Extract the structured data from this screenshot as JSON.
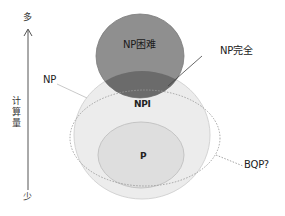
{
  "axis": {
    "top_label": "多",
    "bottom_label": "少",
    "title_chars": [
      "计",
      "算",
      "量"
    ],
    "title": "计算量"
  },
  "sets": {
    "np_hard": {
      "label": "NP困难",
      "fill": "#8f8f8f",
      "stroke": "#777777"
    },
    "np_complete": {
      "label": "NP完全",
      "fill": "#6b6b6b"
    },
    "np": {
      "label": "NP",
      "fill": "#ececec",
      "stroke": "#d4d4d4"
    },
    "npi": {
      "label": "NPI"
    },
    "p": {
      "label": "P",
      "fill": "#dedede",
      "stroke": "#c4c4c4"
    },
    "bqp": {
      "label": "BQP?",
      "stroke": "#999999"
    }
  },
  "colors": {
    "background": "#ffffff",
    "axis_line": "#555555",
    "text": "#222222",
    "leader_line": "#bbbbbb"
  }
}
